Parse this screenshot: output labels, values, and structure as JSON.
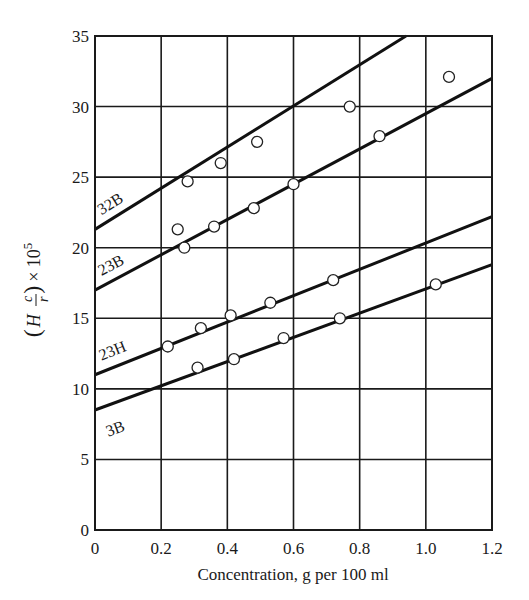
{
  "chart_data": {
    "type": "scatter",
    "title": "",
    "xlabel": "Concentration, g per 100 ml",
    "ylabel": "(H c/r) × 10^5",
    "ylabel_parts": {
      "open": "(",
      "H": "H",
      "num": "c",
      "den": "r",
      "close": ")",
      "times": "× 10",
      "exp": "5"
    },
    "xlim": [
      0,
      1.2
    ],
    "ylim": [
      0,
      35
    ],
    "x_ticks": [
      0,
      0.2,
      0.4,
      0.6,
      0.8,
      1.0,
      1.2
    ],
    "x_tick_labels": [
      "0",
      "0.2",
      "0.4",
      "0.6",
      "0.8",
      "1.0",
      "1.2"
    ],
    "y_ticks": [
      0,
      5,
      10,
      15,
      20,
      25,
      30,
      35
    ],
    "y_tick_labels": [
      "0",
      "5",
      "10",
      "15",
      "20",
      "25",
      "30",
      "35"
    ],
    "grid": true,
    "legend": "none (series labeled inline on lines)",
    "series": [
      {
        "name": "32B",
        "points": [
          [
            0.28,
            24.7
          ],
          [
            0.38,
            26.0
          ],
          [
            0.49,
            27.5
          ],
          [
            0.77,
            30.0
          ]
        ],
        "fit_line": {
          "x": [
            0,
            0.94
          ],
          "y": [
            21.3,
            35.0
          ]
        },
        "label_pos": {
          "x": 0.02,
          "y": 22.3
        }
      },
      {
        "name": "23B",
        "points": [
          [
            0.25,
            21.3
          ],
          [
            0.27,
            20.0
          ],
          [
            0.36,
            21.5
          ],
          [
            0.48,
            22.8
          ],
          [
            0.6,
            24.5
          ],
          [
            0.86,
            27.9
          ],
          [
            1.07,
            32.1
          ]
        ],
        "fit_line": {
          "x": [
            0,
            1.2
          ],
          "y": [
            17.0,
            32.0
          ]
        },
        "label_pos": {
          "x": 0.02,
          "y": 18.0
        }
      },
      {
        "name": "23H",
        "points": [
          [
            0.22,
            13.0
          ],
          [
            0.32,
            14.3
          ],
          [
            0.41,
            15.2
          ],
          [
            0.53,
            16.1
          ],
          [
            0.72,
            17.7
          ]
        ],
        "fit_line": {
          "x": [
            0,
            1.2
          ],
          "y": [
            11.0,
            22.2
          ]
        },
        "label_pos": {
          "x": 0.02,
          "y": 12.0
        }
      },
      {
        "name": "3B",
        "points": [
          [
            0.31,
            11.5
          ],
          [
            0.42,
            12.1
          ],
          [
            0.57,
            13.6
          ],
          [
            0.74,
            15.0
          ],
          [
            1.03,
            17.4
          ]
        ],
        "fit_line": {
          "x": [
            0,
            1.2
          ],
          "y": [
            8.5,
            18.8
          ]
        },
        "label_pos": {
          "x": 0.04,
          "y": 6.6
        }
      }
    ]
  }
}
